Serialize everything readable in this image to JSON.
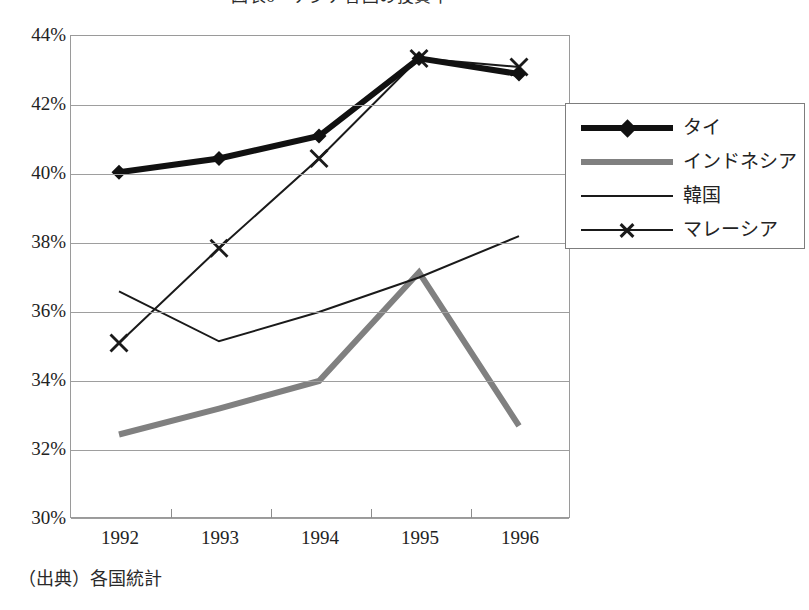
{
  "title": "図表6　アジア各国の投資率",
  "source_note": "（出典）各国統計",
  "axis": {
    "y_ticks": [
      "44%",
      "42%",
      "40%",
      "38%",
      "36%",
      "34%",
      "32%",
      "30%"
    ],
    "x_ticks": [
      "1992",
      "1993",
      "1994",
      "1995",
      "1996"
    ]
  },
  "legend": {
    "items": [
      {
        "label": "タイ",
        "marker": "diamond-marker",
        "color": "#111111",
        "width": 6
      },
      {
        "label": "インドネシア",
        "marker": "none",
        "color": "#808080",
        "width": 6
      },
      {
        "label": "韓国",
        "marker": "none",
        "color": "#1a1a1a",
        "width": 2
      },
      {
        "label": "マレーシア",
        "marker": "x-marker",
        "color": "#1a1a1a",
        "width": 2
      }
    ]
  },
  "chart_data": {
    "type": "line",
    "title": "図表6　アジア各国の投資率",
    "xlabel": "",
    "ylabel": "",
    "x": [
      "1992",
      "1993",
      "1994",
      "1995",
      "1996"
    ],
    "categories": [
      "1992",
      "1993",
      "1994",
      "1995",
      "1996"
    ],
    "ylim": [
      30,
      44
    ],
    "ytick_values": [
      30,
      32,
      34,
      36,
      38,
      40,
      42,
      44
    ],
    "ytick_labels": [
      "30%",
      "32%",
      "34%",
      "36%",
      "38%",
      "40%",
      "42%",
      "44%"
    ],
    "grid": true,
    "legend_position": "right",
    "series": [
      {
        "name": "タイ",
        "color": "#111111",
        "line_width": 6,
        "marker": "diamond",
        "values": [
          40.05,
          40.45,
          41.1,
          43.35,
          42.9
        ]
      },
      {
        "name": "インドネシア",
        "color": "#808080",
        "line_width": 6,
        "marker": "none",
        "values": [
          32.45,
          33.2,
          34.0,
          37.15,
          32.7
        ]
      },
      {
        "name": "韓国",
        "color": "#1a1a1a",
        "line_width": 2,
        "marker": "none",
        "values": [
          36.6,
          35.15,
          36.0,
          37.0,
          38.2
        ]
      },
      {
        "name": "マレーシア",
        "color": "#1a1a1a",
        "line_width": 2,
        "marker": "x",
        "values": [
          35.1,
          37.85,
          40.45,
          43.35,
          43.1
        ]
      }
    ]
  }
}
